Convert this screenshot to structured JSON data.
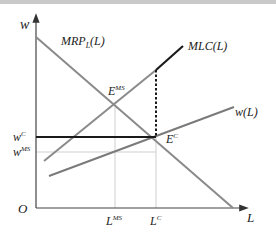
{
  "diagram": {
    "type": "economics-monopsony-labor-market",
    "axes": {
      "y_label": "w",
      "x_label": "L",
      "origin_label": "O"
    },
    "curves": {
      "mrp": {
        "label": "MRP",
        "sub": "L",
        "arg": "(L)"
      },
      "mlc": {
        "label": "MLC(L)"
      },
      "supply": {
        "label": "w(L)"
      }
    },
    "points": {
      "e_ms": {
        "label": "E",
        "sup": "MS"
      },
      "e_c": {
        "label": "E",
        "sup": "C"
      }
    },
    "wage_ticks": {
      "w_c": {
        "label": "w",
        "sup": "C"
      },
      "w_ms": {
        "label": "w",
        "sup": "MS"
      }
    },
    "quantity_ticks": {
      "l_ms": {
        "label": "L",
        "sup": "MS"
      },
      "l_c": {
        "label": "L",
        "sup": "C"
      }
    },
    "colors": {
      "axis": "#444444",
      "curve_gray": "#8a8a8a",
      "bold": "#1a1a1a",
      "guide": "#cccccc"
    }
  }
}
